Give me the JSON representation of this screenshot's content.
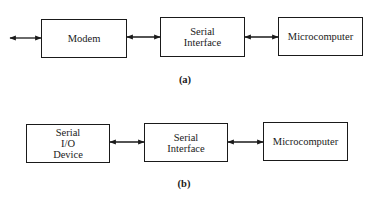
{
  "diagram_a": {
    "caption": "(a)",
    "blocks": [
      {
        "id": "modem",
        "label": "Modem"
      },
      {
        "id": "serial-interface",
        "label": "Serial\nInterface"
      },
      {
        "id": "microcomputer",
        "label": "Microcomputer"
      }
    ],
    "connections": [
      {
        "from": "external",
        "to": "modem",
        "type": "bidirectional"
      },
      {
        "from": "modem",
        "to": "serial-interface",
        "type": "bidirectional"
      },
      {
        "from": "serial-interface",
        "to": "microcomputer",
        "type": "bidirectional"
      }
    ]
  },
  "diagram_b": {
    "caption": "(b)",
    "blocks": [
      {
        "id": "serial-io-device",
        "label": "Serial\nI/O\nDevice"
      },
      {
        "id": "serial-interface",
        "label": "Serial\nInterface"
      },
      {
        "id": "microcomputer",
        "label": "Microcomputer"
      }
    ],
    "connections": [
      {
        "from": "serial-io-device",
        "to": "serial-interface",
        "type": "bidirectional"
      },
      {
        "from": "serial-interface",
        "to": "microcomputer",
        "type": "bidirectional"
      }
    ]
  },
  "colors": {
    "line": "#1a1a1a",
    "background": "#ffffff"
  }
}
